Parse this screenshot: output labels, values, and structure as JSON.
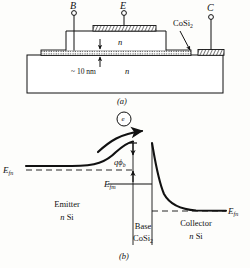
{
  "figure": {
    "caption_a": "(a)",
    "caption_b": "(b)"
  },
  "panel_a": {
    "title": "Metal base transistor cross section",
    "terminals": [
      {
        "name": "base-terminal",
        "label": "B"
      },
      {
        "name": "emitter-terminal",
        "label": "E"
      },
      {
        "name": "collector-terminal",
        "label": "C"
      }
    ],
    "material_callout": "CoSi",
    "material_callout_sub": "2",
    "emitter_region_label": "n",
    "substrate_region_label": "n",
    "thickness_label": "~ 10 nm"
  },
  "panel_b": {
    "title": "Energy band diagram",
    "carrier_label": "e",
    "barrier_label_q": "q",
    "barrier_label_phi": "ϕ",
    "barrier_label_sub": "b",
    "fermi_emitter": {
      "symbol": "E",
      "sub": "fn"
    },
    "fermi_metal": {
      "symbol": "E",
      "sub": "fm"
    },
    "fermi_collector": {
      "symbol": "E",
      "sub": "fn"
    },
    "regions": [
      {
        "name": "emitter-region",
        "line1": "Emitter",
        "line2_italic": "n",
        "line2_rest": " Si"
      },
      {
        "name": "base-region",
        "line1": "Base",
        "line2_italic": "CoSi",
        "line2_sub": "2"
      },
      {
        "name": "collector-region",
        "line1": "Collector",
        "line2_italic": "n",
        "line2_rest": " Si"
      }
    ]
  },
  "colors": {
    "ink": "#111111",
    "hatch": "#1a1a1a",
    "paper": "#fdfdfb"
  }
}
